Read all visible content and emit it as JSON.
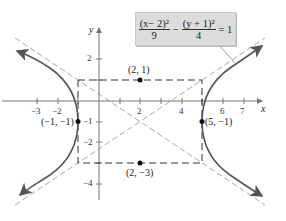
{
  "equation": {
    "term1_numerator": "(x− 2)²",
    "term1_denominator": "9",
    "minus": "−",
    "term2_numerator": "(y + 1)²",
    "term2_denominator": "4",
    "equals": "= 1"
  },
  "axes": {
    "x_label": "x",
    "y_label": "y",
    "x_ticks": [
      "−3",
      "−2",
      "2",
      "4",
      "6",
      "7"
    ],
    "y_ticks": [
      "2",
      "−1",
      "−2",
      "−4"
    ]
  },
  "points": [
    {
      "label": "(2, 1)",
      "x": 2,
      "y": 1
    },
    {
      "label": "(−1, −1)",
      "x": -1,
      "y": -1
    },
    {
      "label": "(5, −1)",
      "x": 5,
      "y": -1
    },
    {
      "label": "(2, −3)",
      "x": 2,
      "y": -3
    }
  ],
  "hyperbola": {
    "center": [
      2,
      -1
    ],
    "a": 3,
    "b": 2,
    "orientation": "horizontal"
  },
  "colors": {
    "curve": "#555555",
    "asymptote": "#aaaaaa",
    "box": "#333333",
    "equation_bg": "#dcdcdc"
  }
}
